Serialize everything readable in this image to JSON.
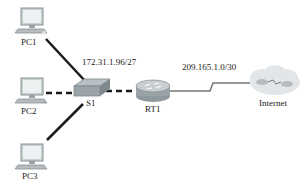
{
  "diagram": {
    "type": "network-topology",
    "nodes": [
      {
        "id": "pc1",
        "label": "PC1",
        "kind": "pc"
      },
      {
        "id": "pc2",
        "label": "PC2",
        "kind": "pc"
      },
      {
        "id": "pc3",
        "label": "PC3",
        "kind": "pc"
      },
      {
        "id": "s1",
        "label": "S1",
        "kind": "switch"
      },
      {
        "id": "rt1",
        "label": "RT1",
        "kind": "router"
      },
      {
        "id": "internet",
        "label": "Internet",
        "kind": "cloud"
      }
    ],
    "links": [
      {
        "from": "pc1",
        "to": "s1",
        "style": "solid"
      },
      {
        "from": "pc2",
        "to": "s1",
        "style": "dashed"
      },
      {
        "from": "pc3",
        "to": "s1",
        "style": "solid"
      },
      {
        "from": "s1",
        "to": "rt1",
        "style": "dashed"
      },
      {
        "from": "rt1",
        "to": "internet",
        "style": "serial"
      }
    ],
    "networks": {
      "lan": "172.31.1.96/27",
      "wan": "209.165.1.0/30"
    },
    "colors": {
      "link": "#1a1a1a",
      "serial": "#777777",
      "device_body": "#9aa3a8",
      "screen": "#eef1f2"
    }
  }
}
